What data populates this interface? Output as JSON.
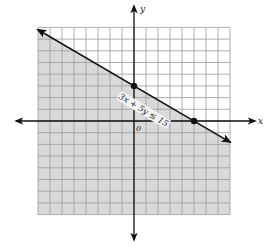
{
  "figure": {
    "inequality_label": "3x + 5y ≤ 15",
    "axis_x_label": "x",
    "axis_y_label": "y",
    "origin_label": "0",
    "grid": {
      "xmin": -8,
      "xmax": 8,
      "ymin": -8,
      "ymax": 8,
      "step": 1
    },
    "boundary_line": {
      "equation": "3x + 5y = 15",
      "style": "solid"
    },
    "points": [
      {
        "name": "y-intercept",
        "x": 0,
        "y": 3
      },
      {
        "name": "x-intercept",
        "x": 5,
        "y": 0
      }
    ],
    "shaded_region": "below line",
    "colors": {
      "shade": "#d9d9d9",
      "grid": "#9a9a9a",
      "line": "#111111",
      "background": "#ffffff"
    }
  }
}
